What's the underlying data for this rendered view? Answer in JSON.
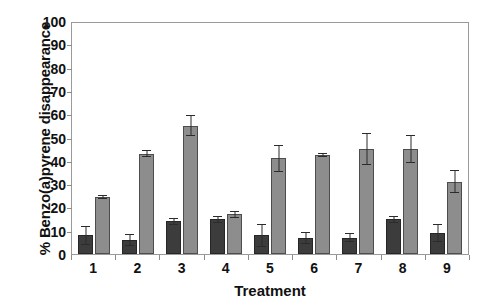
{
  "chart_data": {
    "type": "bar",
    "title": "",
    "xlabel": "Treatment",
    "ylabel": "% Benzo(a)pyrene disappearance",
    "categories": [
      "1",
      "2",
      "3",
      "4",
      "5",
      "6",
      "7",
      "8",
      "9"
    ],
    "ylim": [
      0,
      100
    ],
    "yticks": [
      0,
      10,
      20,
      30,
      40,
      50,
      60,
      70,
      80,
      90,
      100
    ],
    "ytick_labels": [
      "0",
      "10",
      "20",
      "30",
      "40",
      "50",
      "60",
      "70",
      "80",
      "90",
      "100"
    ],
    "grid": false,
    "legend": "none",
    "series": [
      {
        "name": "dark-series",
        "color": "#3c3c3c",
        "values": [
          8,
          6,
          14,
          15,
          8,
          7,
          7,
          15,
          9
        ],
        "errors": [
          4,
          2.5,
          1.5,
          1.5,
          5,
          2.5,
          2,
          1.5,
          4
        ]
      },
      {
        "name": "light-series",
        "color": "#8d8d8d",
        "values": [
          24.5,
          43,
          55,
          17,
          41,
          42.5,
          45,
          45,
          31
        ],
        "errors": [
          0.8,
          1.5,
          4.5,
          1.5,
          6,
          0.8,
          7,
          6,
          5
        ]
      }
    ]
  },
  "axis": {
    "y_title": "% Benzo(a)pyrene disappearance",
    "x_title": "Treatment"
  }
}
